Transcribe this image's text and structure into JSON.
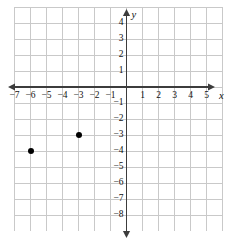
{
  "chart_data": {
    "type": "scatter",
    "title": "",
    "xlabel": "x",
    "ylabel": "y",
    "xlim": [
      -7.5,
      5.5
    ],
    "ylim": [
      -8.5,
      4.5
    ],
    "grid": true,
    "legend": "none",
    "x_tick_labels": [
      "−7",
      "−6",
      "−5",
      "−4",
      "−3",
      "−2",
      "−1",
      "1",
      "2",
      "3",
      "4",
      "5"
    ],
    "x_tick_values": [
      -7,
      -6,
      -5,
      -4,
      -3,
      -2,
      -1,
      1,
      2,
      3,
      4,
      5
    ],
    "y_tick_labels": [
      "4",
      "3",
      "2",
      "1",
      "−1",
      "−2",
      "−3",
      "−4",
      "−5",
      "−6",
      "−7",
      "−8"
    ],
    "y_tick_values": [
      4,
      3,
      2,
      1,
      -1,
      -2,
      -3,
      -4,
      -5,
      -6,
      -7,
      -8
    ],
    "points": [
      {
        "x": -6,
        "y": -4,
        "label": "(−6, −4)"
      },
      {
        "x": -3,
        "y": -3,
        "label": "(−3, −3)"
      }
    ],
    "colors": {
      "grid": "#c9c9c9",
      "axis": "#3c3c3c",
      "point": "#000000",
      "background": "#ffffff",
      "text": "#101010"
    }
  },
  "geometry": {
    "width": 234,
    "height": 244,
    "cell": 16.0,
    "origin_x": 126.5,
    "origin_y": 87.0,
    "grid_left": 14.5,
    "grid_right": 222.5,
    "grid_top": 7.0,
    "grid_bottom": 231.0
  }
}
